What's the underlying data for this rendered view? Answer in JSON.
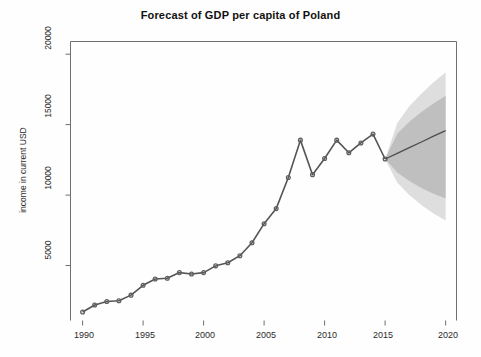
{
  "chart_data": {
    "type": "line",
    "title": "Forecast of GDP per capita of Poland",
    "xlabel": "",
    "ylabel": "income in current USD",
    "xlim": [
      1989.0,
      2020.9
    ],
    "ylim": [
      1100,
      20900
    ],
    "grid": false,
    "legend": "none",
    "xticks": [
      1990,
      1995,
      2000,
      2005,
      2010,
      2015,
      2020
    ],
    "xtick_labels": [
      "1990",
      "1995",
      "2000",
      "2005",
      "2010",
      "2015",
      "2020"
    ],
    "yticks": [
      5000,
      10000,
      15000,
      20000
    ],
    "ytick_labels": [
      "5000",
      "10000",
      "15000",
      "20000"
    ],
    "series": [
      {
        "name": "observed",
        "style": "line-with-circle-markers",
        "color": "#555555",
        "x": [
          1990,
          1991,
          1992,
          1993,
          1994,
          1995,
          1996,
          1997,
          1998,
          1999,
          2000,
          2001,
          2002,
          2003,
          2004,
          2005,
          2006,
          2007,
          2008,
          2009,
          2010,
          2011,
          2012,
          2013,
          2014,
          2015
        ],
        "values": [
          1700,
          2200,
          2450,
          2500,
          2900,
          3600,
          4050,
          4100,
          4500,
          4400,
          4500,
          4980,
          5200,
          5700,
          6620,
          7970,
          9040,
          11250,
          13900,
          11450,
          12600,
          13900,
          13000,
          13700,
          14330,
          12560
        ]
      },
      {
        "name": "forecast mean",
        "style": "line",
        "color": "#4d4d4d",
        "x": [
          2015,
          2016,
          2017,
          2018,
          2019,
          2020
        ],
        "values": [
          12560,
          12960,
          13370,
          13770,
          14180,
          14580
        ]
      }
    ],
    "intervals": [
      {
        "name": "80% prediction interval",
        "color": "#bfbfbf",
        "x": [
          2015,
          2016,
          2017,
          2018,
          2019,
          2020
        ],
        "lower": [
          12560,
          11600,
          11000,
          10500,
          10100,
          9750
        ],
        "upper": [
          12560,
          14350,
          15200,
          15900,
          16500,
          17050
        ]
      },
      {
        "name": "95% prediction interval",
        "color": "#dedede",
        "x": [
          2015,
          2016,
          2017,
          2018,
          2019,
          2020
        ],
        "lower": [
          12560,
          10900,
          10000,
          9300,
          8700,
          8200
        ],
        "upper": [
          12560,
          15100,
          16300,
          17200,
          18000,
          18700
        ]
      }
    ]
  },
  "colors": {
    "axis": "#6f6f6f",
    "line": "#555555",
    "marker": "#606060",
    "band_inner": "#bfbfbf",
    "band_outer": "#dedede",
    "background": "#fefefe",
    "text": "#1a1a1a"
  },
  "axes": {
    "title": "Forecast of GDP per capita of Poland",
    "ylabel": "income in current USD",
    "ytick_labels": [
      "5000",
      "10000",
      "15000",
      "20000"
    ],
    "xtick_labels": [
      "1990",
      "1995",
      "2000",
      "2005",
      "2010",
      "2015",
      "2020"
    ]
  }
}
